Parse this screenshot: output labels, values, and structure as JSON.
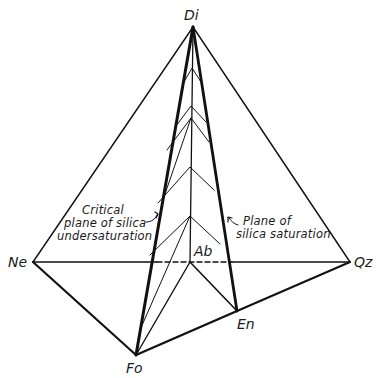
{
  "diagram": {
    "type": "tetrahedron-phase-diagram",
    "vertices": {
      "di": {
        "label": "Di",
        "x": 193,
        "y": 27
      },
      "ne": {
        "label": "Ne",
        "x": 33,
        "y": 262
      },
      "qz": {
        "label": "Qz",
        "x": 350,
        "y": 262
      },
      "ab": {
        "label": "Ab",
        "x": 190,
        "y": 262
      },
      "fo": {
        "label": "Fo",
        "x": 136,
        "y": 355
      },
      "en": {
        "label": "En",
        "x": 237,
        "y": 311
      }
    },
    "annotations": {
      "critical_plane": {
        "line1": "Critical",
        "line2": "plane of silica",
        "line3": "undersaturation"
      },
      "saturation_plane": {
        "line1": "Plane of",
        "line2": "silica saturation"
      }
    },
    "colors": {
      "line": "#111111",
      "background": "#ffffff"
    }
  }
}
